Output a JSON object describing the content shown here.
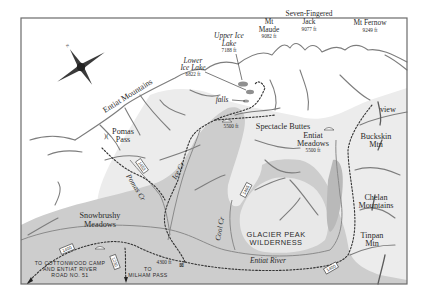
{
  "map": {
    "title_region": "Entiat Mountains / Glacier Peak Wilderness trail map",
    "colors": {
      "frame": "#6b6b6b",
      "background": "#ffffff",
      "valley_fill": "#c9c9c9",
      "upper_valley_fill": "#dcdcdc",
      "lake_fill": "#8f8f8f",
      "ridge": "#7d7d7d",
      "trail": "#333333"
    },
    "compass": {
      "name": "compass-rose"
    },
    "ranges": {
      "entiat": "Entiat Mountains",
      "chelan_1": "Chelan",
      "chelan_2": "Mountains"
    },
    "peaks": {
      "maude": {
        "line1": "Mt",
        "line2": "Maude",
        "elev": "9082 ft"
      },
      "jack": {
        "line1": "Seven-Fingered",
        "line2": "Jack",
        "elev": "9077 ft"
      },
      "fernow": {
        "line1": "Mt Fernow",
        "elev": "9249 ft"
      },
      "buckskin": {
        "line1": "Buckskin",
        "line2": "Mtn"
      },
      "tinpan": {
        "line1": "Tinpan",
        "line2": "Mtn"
      }
    },
    "lakes": {
      "upper": {
        "line1": "Upper Ice",
        "line2": "Lake",
        "elev": "7188 ft"
      },
      "lower": {
        "line1": "Lower",
        "line2": "Ice Lake",
        "elev": "6822 ft"
      }
    },
    "features": {
      "falls": "falls",
      "view": "view",
      "spectacle": "Spectacle Buttes",
      "camp_elev": "5500 ft",
      "meadows_1": "Entiat",
      "meadows_2": "Meadows",
      "meadows_elev": "5500 ft",
      "pomas_1": "Pomas",
      "pomas_2": "Pass",
      "snowbrushy_1": "Snowbrushy",
      "snowbrushy_2": "Meadows",
      "trailhead_elev": "4300 ft",
      "wilderness_1": "GLACIER PEAK",
      "wilderness_2": "WILDERNESS"
    },
    "waterways": {
      "pomas_creek": "Pomas Cr",
      "ice_creek": "Ice Cr",
      "cool_creek": "Cool Cr",
      "entiat_river": "Entiat River"
    },
    "trail_numbers": {
      "t1453": "1453",
      "t1405": "1405",
      "t1400_west": "1400",
      "t1400_east": "1400",
      "t1230": "1230"
    },
    "destinations": {
      "cottonwood_1": "TO COTTONWOOD CAMP",
      "cottonwood_2": "AND ENTIAT RIVER",
      "cottonwood_3": "ROAD NO. 51",
      "milham_1": "TO",
      "milham_2": "MILHAM PASS"
    }
  }
}
